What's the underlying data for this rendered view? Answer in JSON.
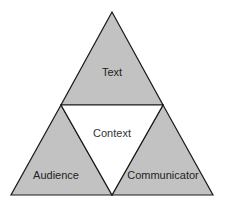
{
  "diagram": {
    "type": "subdivided-triangle",
    "colors": {
      "corner_fill": "#c2c2c2",
      "center_fill": "#ffffff",
      "outline": "#1a1a1a",
      "text": "#222222"
    },
    "sections": {
      "top": {
        "label": "Text"
      },
      "center": {
        "label": "Context"
      },
      "bottom_left": {
        "label": "Audience"
      },
      "bottom_right": {
        "label": "Communicator"
      }
    }
  }
}
